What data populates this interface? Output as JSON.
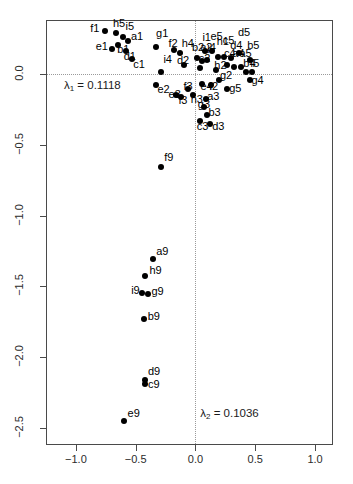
{
  "chart_data": {
    "type": "scatter",
    "title": "",
    "xlabel": "",
    "ylabel": "",
    "xlim": [
      -1.25,
      1.15
    ],
    "ylim": [
      -2.62,
      0.38
    ],
    "grid": false,
    "reference_lines": {
      "x": 0.0,
      "y": 0.0,
      "style": "dotted"
    },
    "xticks": [
      -1.0,
      -0.5,
      0.0,
      0.5,
      1.0
    ],
    "xticklabels": [
      "-1.0",
      "-0.5",
      "0.0",
      "0.5",
      "1.0"
    ],
    "yticks": [
      0.0,
      -0.5,
      -1.0,
      -1.5,
      -2.0,
      -2.5
    ],
    "yticklabels": [
      "0.0",
      "-0.5",
      "-1.0",
      "-1.5",
      "-2.0",
      "-2.5"
    ],
    "annotations": [
      {
        "name": "lambda1",
        "symbol": "λ",
        "sub": "1",
        "text": "= 0.1118",
        "x": -1.1,
        "y": -0.085
      },
      {
        "name": "lambda2",
        "symbol": "λ",
        "sub": "2",
        "text": "= 0.1036",
        "x": 0.04,
        "y": -2.4
      }
    ],
    "points": [
      {
        "label": "f1",
        "x": -0.755,
        "y": 0.3,
        "lx": -0.88,
        "ly": 0.318
      },
      {
        "label": "h5",
        "x": -0.665,
        "y": 0.285,
        "lx": -0.69,
        "ly": 0.352
      },
      {
        "label": "i5",
        "x": -0.61,
        "y": 0.258,
        "lx": -0.585,
        "ly": 0.33
      },
      {
        "label": "a1",
        "x": -0.562,
        "y": 0.23,
        "lx": -0.54,
        "ly": 0.262
      },
      {
        "label": "e1",
        "x": -0.7,
        "y": 0.178,
        "lx": -0.835,
        "ly": 0.19
      },
      {
        "label": "b1",
        "x": -0.648,
        "y": 0.205,
        "lx": -0.655,
        "ly": 0.168
      },
      {
        "label": "d1",
        "x": -0.58,
        "y": 0.16,
        "lx": -0.6,
        "ly": 0.118
      },
      {
        "label": "c1",
        "x": -0.53,
        "y": 0.105,
        "lx": -0.52,
        "ly": 0.062
      },
      {
        "label": "g1",
        "x": -0.33,
        "y": 0.19,
        "lx": -0.33,
        "ly": 0.282
      },
      {
        "label": "f2",
        "x": -0.18,
        "y": 0.168,
        "lx": -0.225,
        "ly": 0.21
      },
      {
        "label": "h4",
        "x": -0.13,
        "y": 0.15,
        "lx": -0.115,
        "ly": 0.21
      },
      {
        "label": "i4",
        "x": -0.29,
        "y": 0.01,
        "lx": -0.268,
        "ly": 0.098
      },
      {
        "label": "e2",
        "x": -0.33,
        "y": -0.078,
        "lx": -0.318,
        "ly": -0.115
      },
      {
        "label": "d2",
        "x": -0.098,
        "y": 0.062,
        "lx": -0.155,
        "ly": 0.092
      },
      {
        "label": "b2",
        "x": 0.01,
        "y": 0.112,
        "lx": -0.03,
        "ly": 0.182
      },
      {
        "label": "a2",
        "x": 0.058,
        "y": 0.09,
        "lx": 0.04,
        "ly": 0.18
      },
      {
        "label": "j4",
        "x": 0.1,
        "y": 0.098,
        "lx": 0.098,
        "ly": 0.182
      },
      {
        "label": "c2",
        "x": 0.04,
        "y": 0.04,
        "lx": 0.028,
        "ly": 0.108
      },
      {
        "label": "i1",
        "x": 0.08,
        "y": 0.158,
        "lx": 0.058,
        "ly": 0.252
      },
      {
        "label": "e5",
        "x": 0.14,
        "y": 0.158,
        "lx": 0.125,
        "ly": 0.262
      },
      {
        "label": "h1",
        "x": 0.19,
        "y": 0.12,
        "lx": 0.178,
        "ly": 0.228
      },
      {
        "label": "c5",
        "x": 0.235,
        "y": 0.122,
        "lx": 0.228,
        "ly": 0.232
      },
      {
        "label": "d4",
        "x": 0.3,
        "y": 0.115,
        "lx": 0.29,
        "ly": 0.2
      },
      {
        "label": "d5",
        "x": 0.368,
        "y": 0.15,
        "lx": 0.355,
        "ly": 0.288
      },
      {
        "label": "c4",
        "x": 0.265,
        "y": 0.06,
        "lx": 0.238,
        "ly": 0.138
      },
      {
        "label": "a4",
        "x": 0.322,
        "y": 0.048,
        "lx": 0.308,
        "ly": 0.138
      },
      {
        "label": "a5",
        "x": 0.378,
        "y": 0.045,
        "lx": 0.368,
        "ly": 0.138
      },
      {
        "label": "b5",
        "x": 0.455,
        "y": 0.095,
        "lx": 0.432,
        "ly": 0.195
      },
      {
        "label": "b4",
        "x": 0.42,
        "y": 0.012,
        "lx": 0.4,
        "ly": 0.072
      },
      {
        "label": "f5",
        "x": 0.47,
        "y": 0.01,
        "lx": 0.458,
        "ly": 0.072
      },
      {
        "label": "g4",
        "x": 0.455,
        "y": -0.042,
        "lx": 0.468,
        "ly": -0.048
      },
      {
        "label": "h2",
        "x": 0.168,
        "y": 0.028,
        "lx": 0.158,
        "ly": 0.058
      },
      {
        "label": "g2",
        "x": 0.198,
        "y": -0.042,
        "lx": 0.205,
        "ly": -0.018
      },
      {
        "label": "i2",
        "x": 0.13,
        "y": -0.078,
        "lx": 0.118,
        "ly": -0.09
      },
      {
        "label": "e4",
        "x": 0.058,
        "y": -0.072,
        "lx": 0.042,
        "ly": -0.09
      },
      {
        "label": "g5",
        "x": 0.262,
        "y": -0.11,
        "lx": 0.282,
        "ly": -0.105
      },
      {
        "label": "f3",
        "x": -0.065,
        "y": -0.105,
        "lx": -0.1,
        "ly": -0.095
      },
      {
        "label": "e3",
        "x": -0.16,
        "y": -0.15,
        "lx": -0.225,
        "ly": -0.148
      },
      {
        "label": "i3",
        "x": -0.118,
        "y": -0.162,
        "lx": -0.14,
        "ly": -0.195
      },
      {
        "label": "h3",
        "x": -0.018,
        "y": -0.148,
        "lx": -0.04,
        "ly": -0.182
      },
      {
        "label": "a3",
        "x": 0.085,
        "y": -0.178,
        "lx": 0.098,
        "ly": -0.165
      },
      {
        "label": "g3",
        "x": 0.072,
        "y": -0.232,
        "lx": 0.02,
        "ly": -0.218
      },
      {
        "label": "b3",
        "x": 0.095,
        "y": -0.288,
        "lx": 0.108,
        "ly": -0.278
      },
      {
        "label": "c3",
        "x": 0.038,
        "y": -0.33,
        "lx": 0.01,
        "ly": -0.372
      },
      {
        "label": "d3",
        "x": 0.122,
        "y": -0.352,
        "lx": 0.14,
        "ly": -0.372
      },
      {
        "label": "f9",
        "x": -0.285,
        "y": -0.655,
        "lx": -0.262,
        "ly": -0.595
      },
      {
        "label": "a9",
        "x": -0.355,
        "y": -1.305,
        "lx": -0.328,
        "ly": -1.258
      },
      {
        "label": "h9",
        "x": -0.42,
        "y": -1.43,
        "lx": -0.385,
        "ly": -1.39
      },
      {
        "label": "i9",
        "x": -0.45,
        "y": -1.548,
        "lx": -0.538,
        "ly": -1.535
      },
      {
        "label": "g9",
        "x": -0.395,
        "y": -1.552,
        "lx": -0.368,
        "ly": -1.538
      },
      {
        "label": "b9",
        "x": -0.432,
        "y": -1.73,
        "lx": -0.4,
        "ly": -1.718
      },
      {
        "label": "d9",
        "x": -0.418,
        "y": -2.16,
        "lx": -0.398,
        "ly": -2.105
      },
      {
        "label": "c9",
        "x": -0.418,
        "y": -2.192,
        "lx": -0.398,
        "ly": -2.198
      },
      {
        "label": "e9",
        "x": -0.6,
        "y": -2.452,
        "lx": -0.568,
        "ly": -2.4
      }
    ]
  }
}
